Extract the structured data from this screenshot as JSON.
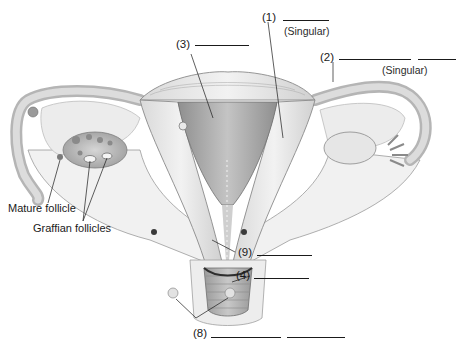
{
  "diagram": {
    "colors": {
      "ink": "#1a1a1a",
      "tissue_light": "#e8e8e8",
      "tissue_mid": "#bdbdbd",
      "tissue_dark": "#8a8a8a",
      "background": "#ffffff"
    }
  },
  "labels": {
    "l1": {
      "number": "(1)",
      "note": "(Singular)"
    },
    "l2": {
      "number": "(2)",
      "note": "(Singular)"
    },
    "l3": {
      "number": "(3)"
    },
    "l4": {
      "number": "(4)"
    },
    "l8": {
      "number": "(8)"
    },
    "l9": {
      "number": "(9)"
    },
    "mature_follicle": "Mature follicle",
    "graafian_follicles": "Graffian follicles"
  }
}
